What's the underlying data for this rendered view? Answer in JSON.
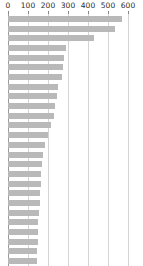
{
  "chart_data": {
    "type": "bar",
    "orientation": "horizontal",
    "title": "",
    "subtitle": "",
    "xlabel": "",
    "ylabel": "",
    "xlim": [
      0,
      600
    ],
    "ylim": null,
    "grid": true,
    "grid_axis": "x",
    "legend": false,
    "legend_position": "none",
    "annotations": [],
    "bar_color": "#b9b9b9",
    "gridline_color": "#d5d5d5",
    "axis_color": "#9a9a9a",
    "tick_label_color": "#2b2b2b",
    "background_color": "#ffffff",
    "xticks": [
      0,
      100,
      200,
      300,
      400,
      500,
      600
    ],
    "xtick_labels": [
      "0",
      "100",
      "200",
      "300",
      "400",
      "500",
      "600"
    ],
    "categories": [
      "",
      "",
      "",
      "",
      "",
      "",
      "",
      "",
      "",
      "",
      "",
      "",
      "",
      "",
      "",
      "",
      "",
      "",
      "",
      "",
      "",
      "",
      "",
      "",
      "",
      ""
    ],
    "values": [
      570,
      535,
      430,
      290,
      282,
      276,
      268,
      252,
      243,
      236,
      228,
      215,
      200,
      186,
      175,
      170,
      167,
      164,
      161,
      158,
      155,
      152,
      150,
      148,
      146,
      144
    ],
    "n_bars": 26,
    "sorted": "descending"
  }
}
